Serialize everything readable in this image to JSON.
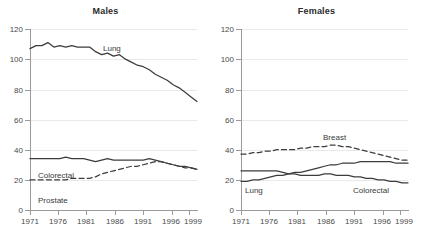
{
  "figure": {
    "panels": [
      "Males",
      "Females"
    ],
    "y_ticks": [
      "0",
      "20",
      "40",
      "60",
      "80",
      "100",
      "120"
    ],
    "x_ticks": [
      "1971",
      "1976",
      "1981",
      "1986",
      "1991",
      "1996",
      "1999"
    ]
  },
  "males": {
    "title": "Males",
    "labels": {
      "lung": "Lung",
      "colorectal": "Colorectal",
      "prostate": "Prostate"
    }
  },
  "females": {
    "title": "Females",
    "labels": {
      "breast": "Breast",
      "lung": "Lung",
      "colorectal": "Colorectal"
    }
  },
  "chart_data": [
    {
      "type": "line",
      "title": "Males",
      "xlabel": "",
      "ylabel": "",
      "xlim": [
        1971,
        1999
      ],
      "ylim": [
        0,
        120
      ],
      "yticks": [
        0,
        20,
        40,
        60,
        80,
        100,
        120
      ],
      "xticks": [
        1971,
        1976,
        1981,
        1986,
        1991,
        1996,
        1999
      ],
      "grid": "horizontal",
      "legend": "inline-labels",
      "x": [
        1971,
        1972,
        1973,
        1974,
        1975,
        1976,
        1977,
        1978,
        1979,
        1980,
        1981,
        1982,
        1983,
        1984,
        1985,
        1986,
        1987,
        1988,
        1989,
        1990,
        1991,
        1992,
        1993,
        1994,
        1995,
        1996,
        1997,
        1998,
        1999
      ],
      "series": [
        {
          "name": "Lung",
          "style": "solid",
          "color": "#3c3c3c",
          "values": [
            107,
            109,
            109,
            111,
            108,
            109,
            108,
            109,
            108,
            108,
            108,
            105,
            103,
            104,
            102,
            103,
            100,
            98,
            96,
            95,
            93,
            90,
            88,
            86,
            83,
            81,
            78,
            75,
            72
          ]
        },
        {
          "name": "Colorectal",
          "style": "solid",
          "color": "#3c3c3c",
          "values": [
            34,
            34,
            34,
            34,
            34,
            34,
            35,
            34,
            34,
            34,
            33,
            32,
            33,
            34,
            33,
            33,
            33,
            33,
            33,
            33,
            34,
            33,
            32,
            31,
            30,
            29,
            29,
            28,
            27
          ]
        },
        {
          "name": "Prostate",
          "style": "dashed",
          "color": "#3c3c3c",
          "values": [
            20,
            20,
            20,
            20,
            20,
            20,
            20,
            21,
            21,
            21,
            21,
            22,
            24,
            25,
            26,
            27,
            28,
            29,
            29,
            30,
            31,
            32,
            32,
            31,
            30,
            29,
            28,
            28,
            27
          ]
        }
      ]
    },
    {
      "type": "line",
      "title": "Females",
      "xlabel": "",
      "ylabel": "",
      "xlim": [
        1971,
        1999
      ],
      "ylim": [
        0,
        120
      ],
      "yticks": [
        0,
        20,
        40,
        60,
        80,
        100,
        120
      ],
      "xticks": [
        1971,
        1976,
        1981,
        1986,
        1991,
        1996,
        1999
      ],
      "grid": "horizontal",
      "legend": "inline-labels",
      "x": [
        1971,
        1972,
        1973,
        1974,
        1975,
        1976,
        1977,
        1978,
        1979,
        1980,
        1981,
        1982,
        1983,
        1984,
        1985,
        1986,
        1987,
        1988,
        1989,
        1990,
        1991,
        1992,
        1993,
        1994,
        1995,
        1996,
        1997,
        1998,
        1999
      ],
      "series": [
        {
          "name": "Breast",
          "style": "dashed",
          "color": "#3c3c3c",
          "values": [
            37,
            37,
            38,
            38,
            39,
            39,
            40,
            40,
            40,
            40,
            41,
            41,
            42,
            42,
            42,
            43,
            43,
            42,
            42,
            41,
            40,
            39,
            38,
            37,
            36,
            35,
            34,
            33,
            33
          ]
        },
        {
          "name": "Lung",
          "style": "solid",
          "color": "#3c3c3c",
          "values": [
            19,
            19,
            20,
            20,
            21,
            22,
            23,
            23,
            24,
            25,
            25,
            26,
            27,
            28,
            29,
            30,
            30,
            31,
            31,
            31,
            32,
            32,
            32,
            32,
            32,
            32,
            31,
            31,
            31
          ]
        },
        {
          "name": "Colorectal",
          "style": "solid",
          "color": "#3c3c3c",
          "values": [
            26,
            26,
            26,
            26,
            26,
            26,
            26,
            25,
            24,
            24,
            23,
            23,
            23,
            23,
            24,
            24,
            23,
            23,
            23,
            22,
            22,
            21,
            21,
            20,
            20,
            19,
            19,
            18,
            18
          ]
        }
      ]
    }
  ]
}
